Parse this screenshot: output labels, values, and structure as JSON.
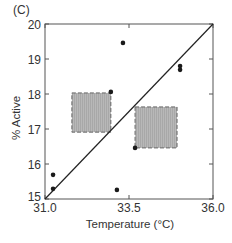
{
  "panel_label": "(C)",
  "chart_data": {
    "type": "scatter",
    "title": "",
    "xlabel": "Temperature (°C)",
    "ylabel": "% Active",
    "xlim": [
      31.0,
      36.0
    ],
    "ylim": [
      15,
      20
    ],
    "x_ticks": [
      31.0,
      33.5,
      36.0
    ],
    "x_tick_labels": [
      "31.0",
      "33.5",
      "36.0"
    ],
    "y_ticks": [
      15,
      16,
      17,
      18,
      19,
      20
    ],
    "y_tick_labels": [
      "15",
      "16",
      "17",
      "18",
      "19",
      "20"
    ],
    "grid": false,
    "legend": null,
    "series": [
      {
        "name": "observations",
        "points": [
          {
            "x": 31.24,
            "y": 15.69
          },
          {
            "x": 31.24,
            "y": 15.29
          },
          {
            "x": 32.96,
            "y": 18.06
          },
          {
            "x": 33.14,
            "y": 15.26
          },
          {
            "x": 33.32,
            "y": 19.46
          },
          {
            "x": 33.68,
            "y": 16.46
          },
          {
            "x": 35.02,
            "y": 18.8
          },
          {
            "x": 35.02,
            "y": 18.69
          }
        ]
      }
    ],
    "reference_line": {
      "x0": 31.0,
      "y0": 15.0,
      "x1": 36.0,
      "y1": 20.0
    },
    "shaded_boxes": [
      {
        "x0": 31.8,
        "x1": 32.96,
        "y0": 16.91,
        "y1": 18.03
      },
      {
        "x0": 33.68,
        "x1": 34.93,
        "y0": 16.46,
        "y1": 17.63
      }
    ],
    "colors": {
      "axis": "#555555",
      "points": "#1a1a1a",
      "line": "#222222",
      "box_fill": "#b8b8b8",
      "box_edge": "#666666"
    }
  }
}
